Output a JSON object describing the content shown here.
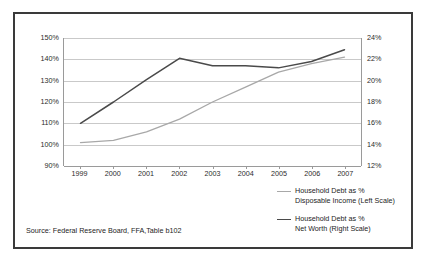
{
  "figure": {
    "source_note": "Source: Federal Reserve Board, FFA,Table b102",
    "border_color": "#3a3a3a",
    "background": "#ffffff"
  },
  "legend": {
    "position": "bottom-right",
    "entries": [
      {
        "label_line1": "Household Debt as %",
        "label_line2": "Disposable Income (Left Scale)",
        "color": "#a8a8a8",
        "swatch_name": "legend-swatch-disposable-income"
      },
      {
        "label_line1": "Household Debt as %",
        "label_line2": "Net Worth (Right Scale)",
        "color": "#4a4a4a",
        "swatch_name": "legend-swatch-net-worth"
      }
    ]
  },
  "axes": {
    "left": {
      "ticks": [
        "90%",
        "100%",
        "110%",
        "120%",
        "130%",
        "140%",
        "150%"
      ],
      "min": 90,
      "max": 150,
      "step": 10
    },
    "right": {
      "ticks": [
        "12%",
        "14%",
        "16%",
        "18%",
        "20%",
        "22%",
        "24%"
      ],
      "min": 12,
      "max": 24,
      "step": 2
    },
    "x": {
      "ticks": [
        "1999",
        "2000",
        "2001",
        "2002",
        "2003",
        "2004",
        "2005",
        "2006",
        "2007"
      ]
    }
  },
  "chart_data": {
    "type": "line",
    "title": "",
    "subtitle": "",
    "xlabel": "",
    "ylabel": "",
    "categories": [
      "1999",
      "2000",
      "2001",
      "2002",
      "2003",
      "2004",
      "2005",
      "2006",
      "2007"
    ],
    "grid": true,
    "legend_position": "bottom-right",
    "axis_left": {
      "label": "Household Debt as % Disposable Income (Left Scale)",
      "ylim": [
        90,
        150
      ],
      "tick_step": 10,
      "tick_labels": [
        "90%",
        "100%",
        "110%",
        "120%",
        "130%",
        "140%",
        "150%"
      ]
    },
    "axis_right": {
      "label": "Household Debt as % Net Worth (Right Scale)",
      "ylim": [
        12,
        24
      ],
      "tick_step": 2,
      "tick_labels": [
        "12%",
        "14%",
        "16%",
        "18%",
        "20%",
        "22%",
        "24%"
      ]
    },
    "series": [
      {
        "name": "Household Debt as % Disposable Income (Left Scale)",
        "axis": "left",
        "color": "#a8a8a8",
        "values": [
          101,
          102,
          106,
          112,
          120,
          127,
          134,
          138,
          141
        ]
      },
      {
        "name": "Household Debt as % Net Worth (Right Scale)",
        "axis": "right",
        "color": "#4a4a4a",
        "values": [
          16.0,
          18.0,
          20.1,
          22.1,
          21.4,
          21.4,
          21.2,
          21.8,
          22.9
        ]
      }
    ],
    "annotations": [
      "Source: Federal Reserve Board, FFA,Table b102"
    ]
  }
}
